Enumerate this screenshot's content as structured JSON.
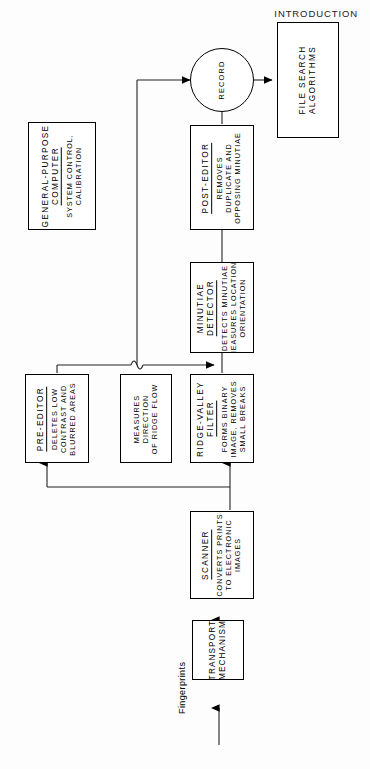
{
  "page": {
    "header": "INTRODUCTION",
    "background_color": "#fdfdfd",
    "ink_color": "#000000",
    "width": 370,
    "height": 769
  },
  "diagram": {
    "type": "flowchart",
    "orientation": "rotated-90-ccw",
    "nodes": {
      "file_search": {
        "title": "FILE SEARCH",
        "title2": "ALGORITHMS",
        "desc": []
      },
      "record": {
        "title": "RECORD"
      },
      "post_editor": {
        "title": "POST-EDITOR",
        "desc_lines": [
          "REMOVES",
          "DUPLICATE  AND",
          "OPPOSING  MINUTIAE"
        ]
      },
      "general_purpose_computer": {
        "title_line1": "GENERAL-PURPOSE",
        "title_line2": "COMPUTER",
        "desc_lines": [
          "SYSTEM  CONTROL,",
          "CALIBRATION"
        ]
      },
      "minutiae_detector": {
        "title_line1": "MINUTIAE",
        "title_line2": "DETECTOR",
        "desc_lines": [
          "DETECTS  MINUTIAE",
          "MEASURES  LOCATION,",
          "ORIENTATION"
        ]
      },
      "pre_editor": {
        "title": "PRE-EDITOR",
        "desc_lines": [
          "DELETES  LOW",
          "CONTRAST  AND",
          "BLURRED  AREAS"
        ]
      },
      "measures": {
        "desc_lines": [
          "MEASURES",
          "DIRECTION",
          "OF RIDGE FLOW"
        ]
      },
      "ridge_valley_filter": {
        "title_line1": "RIDGE-VALLEY",
        "title_line2": "FILTER",
        "desc_lines": [
          "FORMS  BINARY",
          "IMAGE,  REMOVES",
          "SMALL  BREAKS"
        ]
      },
      "scanner": {
        "title": "SCANNER",
        "desc_lines": [
          "CONVERTS  PRINTS",
          "TO  ELECTRONIC",
          "IMAGES"
        ]
      },
      "transport_mechanism": {
        "title_line1": "TRANSPORT",
        "title_line2": "MECHANISM"
      }
    },
    "labels": {
      "input_flow": "Fingerprints"
    }
  }
}
